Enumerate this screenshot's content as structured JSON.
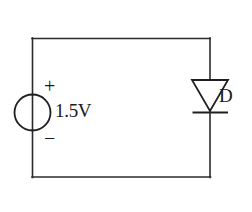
{
  "diagram": {
    "type": "schematic",
    "background_color": "#ffffff",
    "line_color": "#2b2b2b",
    "components": {
      "voltage_source": {
        "symbol_name": "dc-voltage-source-circle",
        "value_label": "1.5V",
        "positive_terminal_label": "+",
        "negative_terminal_label": "−",
        "position": "left-branch"
      },
      "diode": {
        "symbol_name": "diode-triangle-bar",
        "reference_label": "D",
        "orientation": "cathode-down",
        "position": "right-branch"
      },
      "loop": {
        "symbol_name": "rectangular-wire-loop",
        "segments": [
          "top-wire",
          "right-wire",
          "bottom-wire",
          "left-wire"
        ]
      }
    }
  }
}
